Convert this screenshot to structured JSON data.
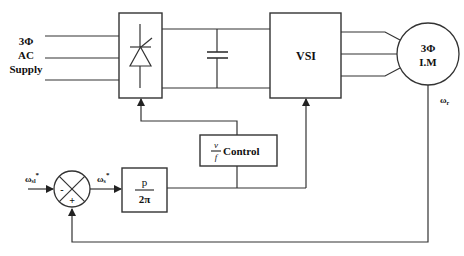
{
  "diagram": {
    "supply": {
      "line1": "3Φ",
      "line2": "AC",
      "line3": "Supply"
    },
    "rectifier": {
      "symbol": "thyristor"
    },
    "dc_link": {
      "symbol": "capacitor"
    },
    "inverter": {
      "label": "VSI"
    },
    "motor": {
      "line1": "3Φ",
      "line2": "I.M"
    },
    "feedback": {
      "label": "ωr",
      "sub": "r"
    },
    "input": {
      "label": "ω",
      "sub": "sl",
      "sup": "*"
    },
    "sum_output": {
      "label": "ω",
      "sub": "s",
      "sup": "*"
    },
    "sum_junction": {
      "minus": "-",
      "plus": "+"
    },
    "gain_block": {
      "num": "p",
      "den": "2π"
    },
    "vf_block": {
      "num": "v",
      "den": "f",
      "label": "Control"
    },
    "colors": {
      "line": "#333333",
      "text": "#111111",
      "bg": "#ffffff"
    }
  }
}
